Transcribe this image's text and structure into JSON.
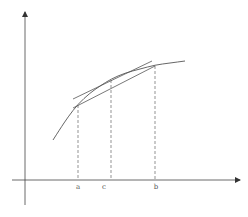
{
  "diagram": {
    "type": "mean-value-theorem",
    "colors": {
      "axis": "#444444",
      "curve": "#555555",
      "secant": "#555555",
      "tangent": "#555555",
      "dashed": "#666666",
      "label": "#555555"
    },
    "axes": {
      "x_axis": {
        "y": 180,
        "x_start": 12,
        "x_end": 240
      },
      "y_axis": {
        "x": 25,
        "y_start": 205,
        "y_end": 12
      }
    },
    "curve_points": [
      [
        53,
        140
      ],
      [
        60,
        129
      ],
      [
        68,
        117
      ],
      [
        78,
        104
      ],
      [
        90,
        93
      ],
      [
        100,
        86
      ],
      [
        111,
        79
      ],
      [
        125,
        73
      ],
      [
        140,
        69
      ],
      [
        155,
        65
      ],
      [
        170,
        63
      ],
      [
        185,
        61
      ]
    ],
    "secant_line": {
      "from": [
        73,
        108
      ],
      "to": [
        155,
        66
      ]
    },
    "tangent_line": {
      "from": [
        73,
        99
      ],
      "to": [
        152,
        61
      ]
    },
    "points": [
      {
        "label": "a",
        "x": 78,
        "y_curve": 105
      },
      {
        "label": "c",
        "x": 111,
        "y_curve": 80
      },
      {
        "label": "b",
        "x": 155,
        "y_curve": 66
      }
    ],
    "labels": {
      "a": "a",
      "c": "c",
      "b": "b"
    }
  }
}
